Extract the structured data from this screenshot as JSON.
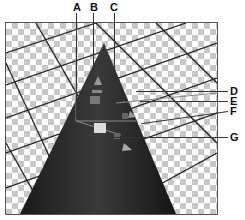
{
  "figure": {
    "callouts": [
      {
        "id": "A",
        "label": "A"
      },
      {
        "id": "B",
        "label": "B"
      },
      {
        "id": "C",
        "label": "C"
      },
      {
        "id": "D",
        "label": "D"
      },
      {
        "id": "E",
        "label": "E"
      },
      {
        "id": "F",
        "label": "F"
      },
      {
        "id": "G",
        "label": "G"
      }
    ]
  }
}
